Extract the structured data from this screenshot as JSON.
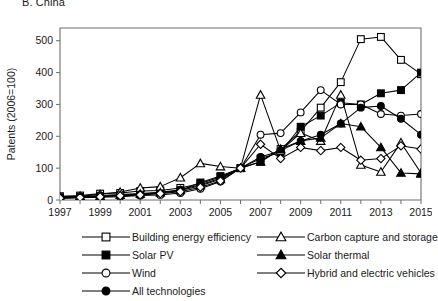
{
  "panel": {
    "title": "B. China"
  },
  "chart_data": {
    "type": "line",
    "title": "B. China",
    "xlabel": "",
    "ylabel": "Patents (2006=100)",
    "xlim": [
      1997,
      2015
    ],
    "ylim": [
      0,
      540
    ],
    "grid": false,
    "legend_position": "bottom",
    "x": [
      1997,
      1998,
      1999,
      2000,
      2001,
      2002,
      2003,
      2004,
      2005,
      2006,
      2007,
      2008,
      2009,
      2010,
      2011,
      2012,
      2013,
      2014,
      2015
    ],
    "xticks": [
      "1997",
      "1999",
      "2001",
      "2003",
      "2005",
      "2007",
      "2009",
      "2011",
      "2013",
      "2015"
    ],
    "yticks": [
      "0",
      "100",
      "200",
      "300",
      "400",
      "500"
    ],
    "series": [
      {
        "name": "Building energy efficiency",
        "marker": "open-square",
        "values": [
          12,
          14,
          20,
          22,
          28,
          30,
          38,
          52,
          72,
          100,
          120,
          160,
          215,
          290,
          370,
          505,
          512,
          440,
          395
        ]
      },
      {
        "name": "Solar PV",
        "marker": "filled-square",
        "values": [
          8,
          10,
          12,
          15,
          18,
          22,
          30,
          55,
          75,
          100,
          130,
          150,
          230,
          265,
          305,
          300,
          335,
          345,
          400
        ]
      },
      {
        "name": "Wind",
        "marker": "open-circle",
        "values": [
          5,
          7,
          9,
          10,
          14,
          16,
          22,
          35,
          58,
          100,
          205,
          210,
          275,
          345,
          300,
          300,
          270,
          265,
          270
        ]
      },
      {
        "name": "All technologies",
        "marker": "filled-circle",
        "values": [
          9,
          11,
          14,
          17,
          20,
          24,
          32,
          48,
          68,
          100,
          135,
          155,
          185,
          205,
          240,
          290,
          295,
          255,
          205
        ]
      },
      {
        "name": "Carbon capture and storage",
        "marker": "open-triangle",
        "values": [
          10,
          12,
          18,
          25,
          38,
          42,
          70,
          115,
          105,
          100,
          330,
          155,
          210,
          185,
          330,
          110,
          88,
          180,
          85
        ]
      },
      {
        "name": "Solar thermal",
        "marker": "filled-triangle",
        "values": [
          7,
          9,
          12,
          15,
          19,
          23,
          30,
          45,
          65,
          100,
          120,
          160,
          185,
          195,
          240,
          230,
          165,
          85,
          82
        ]
      },
      {
        "name": "Hybrid and electric vehicles",
        "marker": "open-diamond",
        "values": [
          6,
          8,
          10,
          13,
          16,
          20,
          26,
          40,
          60,
          100,
          175,
          130,
          165,
          155,
          165,
          125,
          130,
          170,
          160
        ]
      }
    ]
  },
  "legend": {
    "columns": [
      [
        {
          "label": "Building energy efficiency",
          "marker": "open-square"
        },
        {
          "label": "Solar PV",
          "marker": "filled-square"
        },
        {
          "label": "Wind",
          "marker": "open-circle"
        },
        {
          "label": "All technologies",
          "marker": "filled-circle"
        }
      ],
      [
        {
          "label": "Carbon capture and storage",
          "marker": "open-triangle"
        },
        {
          "label": "Solar thermal",
          "marker": "filled-triangle"
        },
        {
          "label": "Hybrid and electric vehicles",
          "marker": "open-diamond"
        }
      ]
    ]
  }
}
